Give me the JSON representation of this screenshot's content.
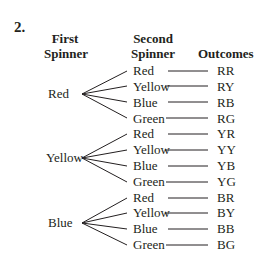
{
  "problem_number": "2.",
  "headers": {
    "first": [
      "First",
      "Spinner"
    ],
    "second": [
      "Second",
      "Spinner"
    ],
    "outcomes": "Outcomes"
  },
  "groups": [
    {
      "first": "Red",
      "branches": [
        {
          "second": "Red",
          "outcome": "RR"
        },
        {
          "second": "Yellow",
          "outcome": "RY"
        },
        {
          "second": "Blue",
          "outcome": "RB"
        },
        {
          "second": "Green",
          "outcome": "RG"
        }
      ]
    },
    {
      "first": "Yellow",
      "branches": [
        {
          "second": "Red",
          "outcome": "YR"
        },
        {
          "second": "Yellow",
          "outcome": "YY"
        },
        {
          "second": "Blue",
          "outcome": "YB"
        },
        {
          "second": "Green",
          "outcome": "YG"
        }
      ]
    },
    {
      "first": "Blue",
      "branches": [
        {
          "second": "Red",
          "outcome": "BR"
        },
        {
          "second": "Yellow",
          "outcome": "BY"
        },
        {
          "second": "Blue",
          "outcome": "BB"
        },
        {
          "second": "Green",
          "outcome": "BG"
        }
      ]
    }
  ]
}
